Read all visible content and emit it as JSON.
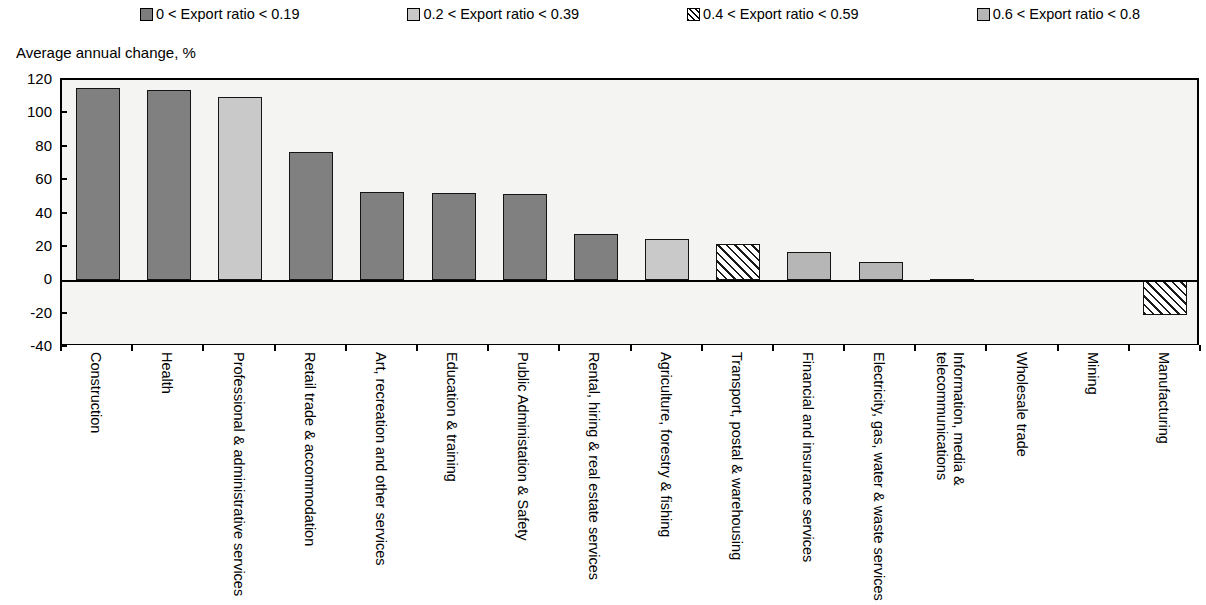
{
  "legend": {
    "items": [
      {
        "label": "0 < Export ratio < 0.19",
        "swatch": "dark",
        "color": "#7d7d7d"
      },
      {
        "label": "0.2 < Export ratio < 0.39",
        "swatch": "light",
        "color": "#c8c8c8"
      },
      {
        "label": "0.4 < Export ratio < 0.59",
        "swatch": "hatch",
        "color": "#000000"
      },
      {
        "label": "0.6 < Export ratio < 0.8",
        "swatch": "pale",
        "color": "#b5b5b5"
      }
    ]
  },
  "axis_title": "Average annual change, %",
  "chart_data": {
    "type": "bar",
    "title": "",
    "subtitle": "",
    "xlabel": "",
    "ylabel": "Average annual change, %",
    "ylim": [
      -40,
      120
    ],
    "yticks": [
      120,
      100,
      80,
      60,
      40,
      20,
      0,
      -20,
      -40
    ],
    "grid": false,
    "legend_position": "top",
    "series_legend": [
      "0 < Export ratio < 0.19",
      "0.2 < Export ratio < 0.39",
      "0.4 < Export ratio < 0.59",
      "0.6 < Export ratio < 0.8"
    ],
    "categories": [
      "Construction",
      "Health",
      "Professional & administrative services",
      "Retail trade & accommodation",
      "Art, recreation and other services",
      "Education & training",
      "Public Administation & Safety",
      "Rental, hiring & real estate services",
      "Agriculture, forestry & fishing",
      "Transport, postal & warehousing",
      "Financial and insurance services",
      "Electricity, gas, water & waste services",
      "Information, media & telecommunications",
      "Wholesale trade",
      "Mining",
      "Manufacturing"
    ],
    "values": [
      115,
      114,
      110,
      77,
      53,
      52.5,
      51.5,
      27.5,
      24.5,
      22,
      17,
      11,
      1,
      0.3,
      -0.8,
      -21
    ],
    "fills": [
      "dark",
      "dark",
      "light",
      "dark",
      "dark",
      "dark",
      "dark",
      "dark",
      "light",
      "hatch",
      "pale",
      "pale",
      "pale",
      "pale",
      "pale",
      "hatch"
    ]
  }
}
